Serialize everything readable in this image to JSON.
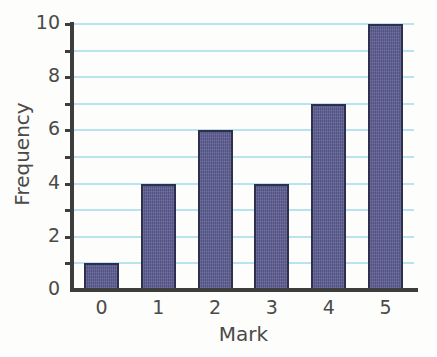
{
  "chart_data": {
    "type": "bar",
    "title": "",
    "subtitle": "",
    "xlabel": "Mark",
    "ylabel": "Frequency",
    "categories": [
      "0",
      "1",
      "2",
      "3",
      "4",
      "5"
    ],
    "values": [
      1,
      4,
      6,
      4,
      7,
      10
    ],
    "series": [
      {
        "name": "Frequency",
        "values": [
          1,
          4,
          6,
          4,
          7,
          10
        ]
      }
    ],
    "xlim": [
      -0.5,
      5.5
    ],
    "ylim": [
      0,
      10
    ],
    "y_tick_labels": [
      "0",
      "2",
      "4",
      "6",
      "8",
      "10"
    ],
    "y_tick_values": [
      0,
      2,
      4,
      6,
      8,
      10
    ],
    "y_minor_tick_values": [
      1,
      3,
      5,
      7,
      9
    ],
    "gridline_values": [
      1,
      2,
      3,
      4,
      5,
      6,
      7,
      8,
      9,
      10
    ],
    "grid": "horizontal",
    "legend": "none",
    "annotations": [],
    "colors": {
      "bar_fill": "#55558a",
      "bar_outline": "#2e2e4e",
      "gridline": "#b9e4ef",
      "axis": "#3d3d3d",
      "text": "#4a4a4a",
      "background": "#fdfdfb"
    }
  }
}
